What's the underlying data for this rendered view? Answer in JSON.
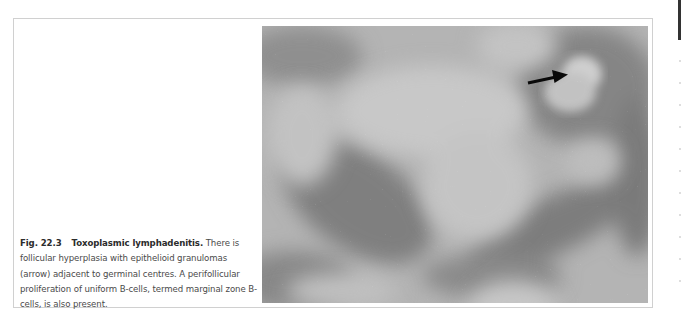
{
  "figure": {
    "number": "Fig. 22.3",
    "title": "Toxoplasmic lymphadenitis.",
    "caption_body": "There is follicular hyperplasia with epithelioid granulomas (arrow) adjacent to germinal centres. A perifollicular proliferation of uniform B-cells, termed marginal zone B-cells, is also present.",
    "image": {
      "description": "Grayscale histology micrograph of lymph node showing follicular hyperplasia, with an arrow pointing to an epithelioid granuloma",
      "annotation": "arrow-icon"
    }
  },
  "colors": {
    "frame_border": "#d0d0d0",
    "caption_text": "#4a4a4a",
    "caption_bold": "#2c2c2c",
    "edge_tab": "#333333"
  }
}
